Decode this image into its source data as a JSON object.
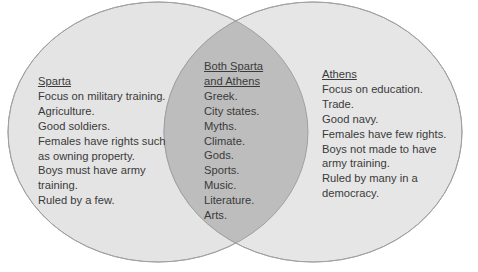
{
  "diagram": {
    "type": "venn",
    "colors": {
      "circle_fill": "#e4e4e4",
      "circle_stroke": "#a9a9a9",
      "overlap_fill": "#bdbdbd",
      "text": "#3a3a3a",
      "background": "#ffffff"
    },
    "sparta": {
      "title": "Sparta",
      "items": [
        "Focus on military training.",
        "Agriculture.",
        "Good soldiers.",
        "Females have rights such",
        "as owning property.",
        "Boys must have army",
        "training.",
        "Ruled by a few."
      ]
    },
    "both": {
      "title_line1": "Both Sparta",
      "title_line2": "and Athens",
      "items": [
        "Greek.",
        "City states.",
        "Myths.",
        "Climate.",
        "Gods.",
        "Sports.",
        "Music.",
        "Literature.",
        "Arts."
      ]
    },
    "athens": {
      "title": "Athens",
      "items": [
        "Focus on education.",
        "Trade.",
        "Good navy.",
        "Females have few rights.",
        "Boys not made to have",
        "army training.",
        "Ruled by many in a",
        "democracy."
      ]
    }
  }
}
